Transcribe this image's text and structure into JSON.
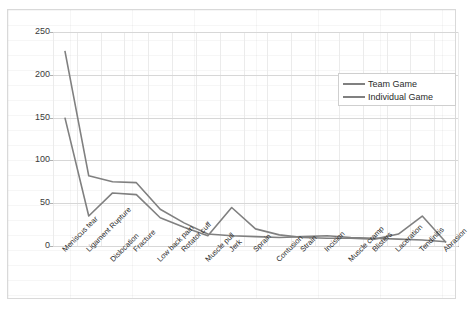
{
  "chart_data": {
    "type": "line",
    "title": "",
    "xlabel": "",
    "ylabel": "",
    "ylim": [
      0,
      250
    ],
    "yticks": [
      0,
      50,
      100,
      150,
      200,
      250
    ],
    "grid": true,
    "legend_position": "upper-right",
    "categories": [
      "Meniscus tear",
      "Ligament Rupture",
      "Dislocation",
      "Fracture",
      "Low back pain",
      "Rotator cuff",
      "Muscle pull",
      "Jerk",
      "Sprain",
      "Contusion",
      "Strain",
      "Incision",
      "Muscle cramp",
      "Blisters",
      "Laceration",
      "Tendinitis",
      "Abrasion"
    ],
    "series": [
      {
        "name": "Team Game",
        "color": "#808080",
        "values": [
          228,
          82,
          75,
          74,
          43,
          27,
          14,
          12,
          11,
          10,
          11,
          12,
          10,
          9,
          8,
          7,
          5
        ]
      },
      {
        "name": "Individual Game",
        "color": "#808080",
        "values": [
          150,
          35,
          62,
          60,
          33,
          22,
          12,
          45,
          20,
          13,
          10,
          9,
          9,
          8,
          14,
          35,
          4
        ]
      }
    ]
  },
  "legend": {
    "items": [
      {
        "label": "Team Game"
      },
      {
        "label": "Individual Game"
      }
    ]
  }
}
